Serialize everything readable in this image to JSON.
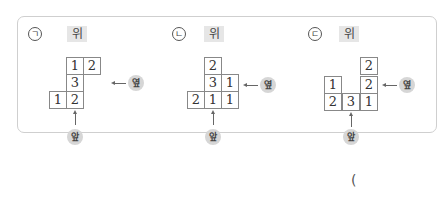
{
  "problems": [
    {
      "marker": "ㄱ",
      "top_label": "위",
      "side_label": "옆",
      "front_label": "앞",
      "cells": [
        {
          "row": 0,
          "col": 1,
          "value": "1"
        },
        {
          "row": 0,
          "col": 2,
          "value": "2"
        },
        {
          "row": 1,
          "col": 1,
          "value": "3"
        },
        {
          "row": 2,
          "col": 0,
          "value": "1"
        },
        {
          "row": 2,
          "col": 1,
          "value": "2"
        }
      ]
    },
    {
      "marker": "ㄴ",
      "top_label": "위",
      "side_label": "옆",
      "front_label": "앞",
      "cells": [
        {
          "row": 0,
          "col": 1,
          "value": "2"
        },
        {
          "row": 1,
          "col": 1,
          "value": "3"
        },
        {
          "row": 1,
          "col": 2,
          "value": "1"
        },
        {
          "row": 2,
          "col": 0,
          "value": "2"
        },
        {
          "row": 2,
          "col": 1,
          "value": "1"
        },
        {
          "row": 2,
          "col": 2,
          "value": "1"
        }
      ]
    },
    {
      "marker": "ㄷ",
      "top_label": "위",
      "side_label": "옆",
      "front_label": "앞",
      "cells": [
        {
          "row": 0,
          "col": 2,
          "value": "2"
        },
        {
          "row": 1,
          "col": 0,
          "value": "1"
        },
        {
          "row": 1,
          "col": 2,
          "value": "2"
        },
        {
          "row": 2,
          "col": 0,
          "value": "2"
        },
        {
          "row": 2,
          "col": 1,
          "value": "3"
        },
        {
          "row": 2,
          "col": 2,
          "value": "1"
        }
      ]
    }
  ],
  "answer_paren": "("
}
